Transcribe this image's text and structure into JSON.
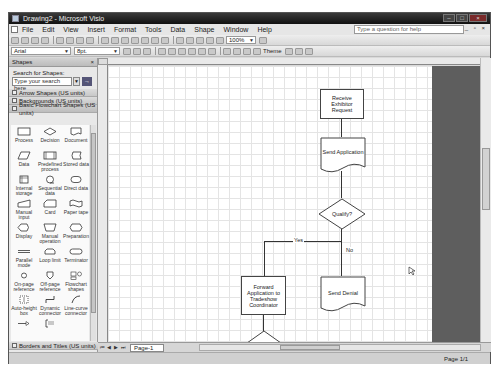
{
  "window": {
    "title": "Drawing2 - Microsoft Visio",
    "controls": [
      "minimize",
      "maximize",
      "close"
    ]
  },
  "menubar": {
    "items": [
      "File",
      "Edit",
      "View",
      "Insert",
      "Format",
      "Tools",
      "Data",
      "Shape",
      "Window",
      "Help"
    ],
    "help_placeholder": "Type a question for help"
  },
  "toolbar": {
    "zoom": "100%",
    "font": "Arial",
    "font_size": "8pt.",
    "theme_label": "Theme"
  },
  "shapes_panel": {
    "title": "Shapes",
    "search_label": "Search for Shapes:",
    "search_placeholder": "Type your search here",
    "stencils": [
      "Arrow Shapes (US units)",
      "Backgrounds (US units)",
      "Basic Flowchart Shapes (US units)"
    ],
    "bottom_stencil": "Borders and Titles (US units)",
    "items": [
      {
        "label": "Process"
      },
      {
        "label": "Decision"
      },
      {
        "label": "Document"
      },
      {
        "label": "Data"
      },
      {
        "label": "Predefined process"
      },
      {
        "label": "Stored data"
      },
      {
        "label": "Internal storage"
      },
      {
        "label": "Sequential data"
      },
      {
        "label": "Direct data"
      },
      {
        "label": "Manual input"
      },
      {
        "label": "Card"
      },
      {
        "label": "Paper tape"
      },
      {
        "label": "Display"
      },
      {
        "label": "Manual operation"
      },
      {
        "label": "Preparation"
      },
      {
        "label": "Parallel mode"
      },
      {
        "label": "Loop limit"
      },
      {
        "label": "Terminator"
      },
      {
        "label": "On-page reference"
      },
      {
        "label": "Off-page reference"
      },
      {
        "label": "Flowchart shapes"
      },
      {
        "label": "Auto-height box"
      },
      {
        "label": "Dynamic connector"
      },
      {
        "label": "Line-curve connector"
      },
      {
        "label": ""
      },
      {
        "label": ""
      },
      {
        "label": ""
      }
    ]
  },
  "flowchart": {
    "receive": "Receive Exhibitor Request",
    "send_app": "Send Application",
    "qualify": "Qualify?",
    "yes": "Yes",
    "no": "No",
    "forward": "Forward Application to Tradeshow Coordinator",
    "send_denial": "Send Denial"
  },
  "page_tabs": {
    "current": "Page-1"
  },
  "status": {
    "page": "Page 1/1"
  }
}
